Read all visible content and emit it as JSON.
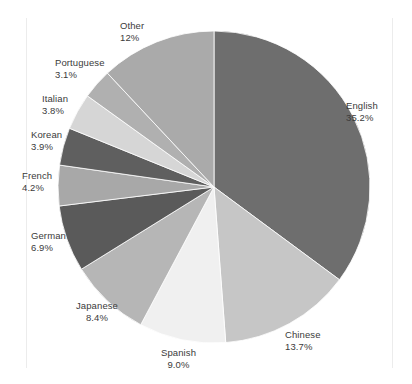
{
  "figure": {
    "top_caption": "",
    "background_color": "#ffffff",
    "label_color": "#3b3b3b"
  },
  "chart_data": {
    "type": "pie",
    "title": "",
    "xlabel": "",
    "ylabel": "",
    "legend_position": "none",
    "grid": false,
    "start_angle_deg": 0,
    "direction": "clockwise",
    "categories": [
      "English",
      "Chinese",
      "Spanish",
      "Japanese",
      "German",
      "French",
      "Korean",
      "Italian",
      "Portuguese",
      "Other"
    ],
    "values": [
      35.2,
      13.7,
      9.0,
      8.4,
      6.9,
      4.2,
      3.9,
      3.8,
      3.1,
      12.0
    ],
    "value_unit": "%",
    "slices": [
      {
        "name": "English",
        "value": 35.2,
        "label": "English",
        "pct_text": "35.2%",
        "color": "#6e6e6e"
      },
      {
        "name": "Chinese",
        "value": 13.7,
        "label": "Chinese",
        "pct_text": "13.7%",
        "color": "#c6c6c6"
      },
      {
        "name": "Spanish",
        "value": 9.0,
        "label": "Spanish",
        "pct_text": "9.0%",
        "color": "#f0f0f0"
      },
      {
        "name": "Japanese",
        "value": 8.4,
        "label": "Japanese",
        "pct_text": "8.4%",
        "color": "#b6b6b6"
      },
      {
        "name": "German",
        "value": 6.9,
        "label": "German",
        "pct_text": "6.9%",
        "color": "#5a5a5a"
      },
      {
        "name": "French",
        "value": 4.2,
        "label": "French",
        "pct_text": "4.2%",
        "color": "#a8a8a8"
      },
      {
        "name": "Korean",
        "value": 3.9,
        "label": "Korean",
        "pct_text": "3.9%",
        "color": "#5f5f5f"
      },
      {
        "name": "Italian",
        "value": 3.8,
        "label": "Italian",
        "pct_text": "3.8%",
        "color": "#d6d6d6"
      },
      {
        "name": "Portuguese",
        "value": 3.1,
        "label": "Portuguese",
        "pct_text": "3.1%",
        "color": "#b0b0b0"
      },
      {
        "name": "Other",
        "value": 12.0,
        "label": "Other",
        "pct_text": "12%",
        "color": "#aaaaaa"
      }
    ]
  },
  "labels": [
    {
      "key": "english",
      "name": "English",
      "pct": "35.2%",
      "x": 346,
      "y": 100,
      "align": "align-left"
    },
    {
      "key": "chinese",
      "name": "Chinese",
      "pct": "13.7%",
      "x": 285,
      "y": 329,
      "align": "align-left"
    },
    {
      "key": "spanish",
      "name": "Spanish",
      "pct": "9.0%",
      "x": 161,
      "y": 347,
      "align": "align-center"
    },
    {
      "key": "japanese",
      "name": "Japanese",
      "pct": "8.4%",
      "x": 76,
      "y": 300,
      "align": "align-center"
    },
    {
      "key": "german",
      "name": "German",
      "pct": "6.9%",
      "x": 31,
      "y": 230,
      "align": "align-left"
    },
    {
      "key": "french",
      "name": "French",
      "pct": "4.2%",
      "x": 22,
      "y": 170,
      "align": "align-left"
    },
    {
      "key": "korean",
      "name": "Korean",
      "pct": "3.9%",
      "x": 31,
      "y": 129,
      "align": "align-left"
    },
    {
      "key": "italian",
      "name": "Italian",
      "pct": "3.8%",
      "x": 42,
      "y": 93,
      "align": "align-left"
    },
    {
      "key": "portuguese",
      "name": "Portuguese",
      "pct": "3.1%",
      "x": 55,
      "y": 57,
      "align": "align-left"
    },
    {
      "key": "other",
      "name": "Other",
      "pct": "12%",
      "x": 120,
      "y": 20,
      "align": "align-left"
    }
  ]
}
